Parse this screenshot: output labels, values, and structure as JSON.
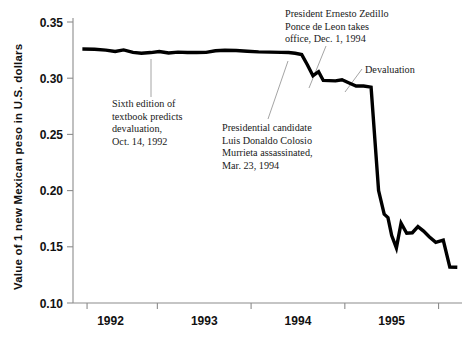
{
  "chart_data": {
    "type": "line",
    "title": "",
    "xlabel": "",
    "ylabel": "Value of 1 new Mexican peso in U.S. dollars",
    "ylim": [
      0.1,
      0.35
    ],
    "xlim": [
      1991.6,
      1995.75
    ],
    "grid": false,
    "legend": "none",
    "line_color": "#000000",
    "axis_color": "#8c8c8c",
    "y_ticks": [
      "0.35",
      "0.30",
      "0.25",
      "0.20",
      "0.15",
      "0.10"
    ],
    "y_tick_values": [
      0.35,
      0.3,
      0.25,
      0.2,
      0.15,
      0.1
    ],
    "x_ticks": [
      "1992",
      "1993",
      "1994",
      "1995"
    ],
    "x_tick_values": [
      1992,
      1993,
      1994,
      1995
    ],
    "x_minor_tick_values": [
      1992.5,
      1993.5,
      1994.5,
      1995.5
    ],
    "series": [
      {
        "name": "Mexican peso value in U.S. dollars",
        "x": [
          1991.7,
          1991.83,
          1991.95,
          1992.05,
          1992.14,
          1992.24,
          1992.33,
          1992.43,
          1992.52,
          1992.62,
          1992.72,
          1992.82,
          1992.92,
          1993.02,
          1993.12,
          1993.22,
          1993.34,
          1993.46,
          1993.58,
          1993.7,
          1993.82,
          1993.9,
          1993.97,
          1994.04,
          1994.1,
          1994.16,
          1994.22,
          1994.27,
          1994.33,
          1994.4,
          1994.47,
          1994.54,
          1994.62,
          1994.7,
          1994.78,
          1994.86,
          1994.92,
          1994.96,
          1995.0,
          1995.05,
          1995.1,
          1995.16,
          1995.22,
          1995.28,
          1995.34,
          1995.4,
          1995.47,
          1995.55,
          1995.62,
          1995.7
        ],
        "y": [
          0.326,
          0.3258,
          0.325,
          0.3238,
          0.3252,
          0.323,
          0.3222,
          0.3228,
          0.3238,
          0.3224,
          0.3232,
          0.3228,
          0.3228,
          0.323,
          0.3244,
          0.3248,
          0.3246,
          0.324,
          0.3234,
          0.3232,
          0.323,
          0.3228,
          0.3222,
          0.321,
          0.312,
          0.3022,
          0.3058,
          0.298,
          0.2978,
          0.2976,
          0.2986,
          0.296,
          0.293,
          0.293,
          0.292,
          0.2,
          0.179,
          0.176,
          0.16,
          0.149,
          0.171,
          0.162,
          0.1625,
          0.168,
          0.164,
          0.159,
          0.154,
          0.156,
          0.132,
          0.1318
        ]
      }
    ],
    "annotations": [
      {
        "id": "textbook",
        "lines": [
          "Sixth edition of",
          "textbook predicts",
          "devaluation,",
          "Oct. 14, 1992"
        ],
        "text_x": 112,
        "text_y": 107,
        "leader": {
          "x1": 151,
          "y1": 59,
          "x2": 151,
          "y2": 97
        }
      },
      {
        "id": "colosio",
        "lines": [
          "Presidential candidate",
          "Luis Donaldo Colosio",
          "Murrieta assassinated,",
          "Mar. 23, 1994"
        ],
        "text_x": 222,
        "text_y": 131,
        "leader": {
          "x1": 288,
          "y1": 61,
          "x2": 268,
          "y2": 119
        }
      },
      {
        "id": "zedillo",
        "lines": [
          "President Ernesto Zedillo",
          "Ponce de Leon takes",
          "office, Dec. 1, 1994"
        ],
        "text_x": 285,
        "text_y": 17,
        "leader": {
          "x1": 326,
          "y1": 46,
          "x2": 309,
          "y2": 88
        }
      },
      {
        "id": "devaluation",
        "lines": [
          "Devaluation"
        ],
        "text_x": 365,
        "text_y": 73,
        "leader": {
          "x1": 362,
          "y1": 69,
          "x2": 345,
          "y2": 92
        }
      }
    ]
  },
  "axis": {
    "y_label": "Value of 1 new Mexican peso in U.S. dollars"
  }
}
